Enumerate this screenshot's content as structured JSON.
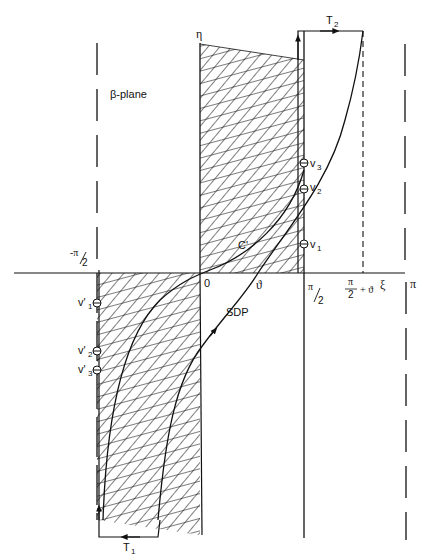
{
  "diagram": {
    "plane_label": "β-plane",
    "axes": {
      "horizontal": "ξ",
      "vertical": "η"
    },
    "tick_labels": {
      "neg_half_pi": "-π/2",
      "origin": "0",
      "theta": "ϑ",
      "half_pi": "π/2",
      "half_pi_plus_theta": "π/2 + ϑ",
      "pi": "π"
    },
    "curves": {
      "contour_c": "C'",
      "steepest_descent_path": "SDP"
    },
    "path_segments": {
      "t1": {
        "name": "T",
        "sub": "1"
      },
      "t2": {
        "name": "T",
        "sub": "2"
      }
    },
    "singularities_upper": [
      {
        "name": "v",
        "sub": "3"
      },
      {
        "name": "v",
        "sub": "2"
      },
      {
        "name": "v",
        "sub": "1"
      }
    ],
    "singularities_lower": [
      {
        "name": "v'",
        "sub": "1"
      },
      {
        "name": "v'",
        "sub": "2"
      },
      {
        "name": "v'",
        "sub": "3"
      }
    ]
  }
}
